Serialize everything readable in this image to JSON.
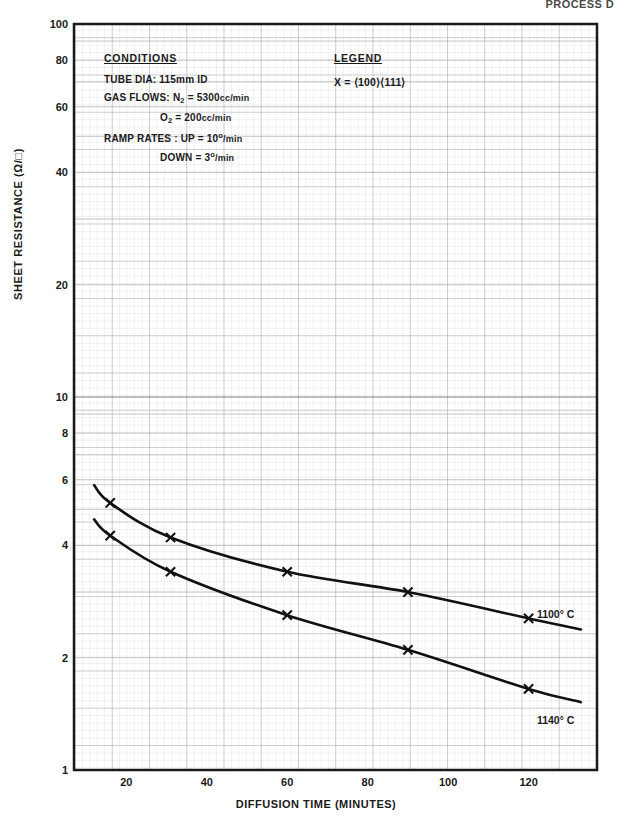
{
  "header": {
    "note": "PROCESS D"
  },
  "chart_data": {
    "type": "line",
    "title": "",
    "xlabel": "DIFFUSION TIME (MINUTES)",
    "ylabel": "SHEET RESISTANCE (Ω/□)",
    "xscale": "linear",
    "yscale": "log",
    "xlim": [
      7,
      137
    ],
    "ylim": [
      1,
      100
    ],
    "grid": true,
    "grid_style": "log-log graph paper, fine minor grid",
    "xticks": [
      20,
      40,
      60,
      80,
      100,
      120
    ],
    "xtick_labels": [
      "20",
      "40",
      "60",
      "80",
      "100",
      "120"
    ],
    "yticks": [
      1,
      2,
      4,
      6,
      8,
      10,
      20,
      40,
      60,
      80,
      100
    ],
    "ytick_labels": [
      "1",
      "2",
      "4",
      "6",
      "8",
      "10",
      "20",
      "40",
      "60",
      "80",
      "100"
    ],
    "marker": "x",
    "legend_position": "inline-right-of-curves",
    "series": [
      {
        "name": "1100° C",
        "label": "1100° C",
        "color": "#111111",
        "x": [
          16,
          31,
          60,
          90,
          120
        ],
        "y": [
          5.2,
          4.2,
          3.4,
          3.0,
          2.55
        ],
        "line_start": {
          "x": 12,
          "y": 5.8
        },
        "line_end": {
          "x": 133,
          "y": 2.38
        }
      },
      {
        "name": "1140° C",
        "label": "1140° C",
        "color": "#111111",
        "x": [
          16,
          31,
          60,
          90,
          120
        ],
        "y": [
          4.25,
          3.4,
          2.6,
          2.1,
          1.65
        ],
        "line_start": {
          "x": 12,
          "y": 4.7
        },
        "line_end": {
          "x": 133,
          "y": 1.52
        }
      }
    ]
  },
  "conditions": {
    "heading": "CONDITIONS",
    "tube_dia_label": "TUBE DIA: 115mm ID",
    "gas_flows_label": "GAS FLOWS:",
    "gas_n2_species": "N",
    "gas_n2_sub": "2",
    "gas_n2_value": "= 5300",
    "gas_n2_units": "cc/min",
    "gas_o2_species": "O",
    "gas_o2_sub": "2",
    "gas_o2_value": "= 200",
    "gas_o2_units": "cc/min",
    "ramp_label": "RAMP RATES : UP = 10",
    "ramp_up_deg": "o",
    "ramp_up_units": "/min",
    "ramp_down_label": "DOWN = 3",
    "ramp_down_deg": "o",
    "ramp_down_units": "/min"
  },
  "legend": {
    "heading": "LEGEND",
    "entry": "X = ⟨100⟩⟨111⟩"
  }
}
